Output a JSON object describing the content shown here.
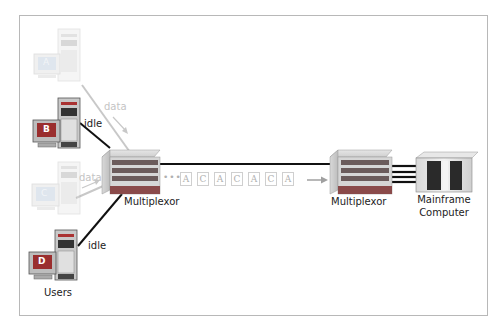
{
  "diagram": {
    "users_label": "Users",
    "terminals": [
      {
        "id": "A",
        "label": "A",
        "state": "faded",
        "link_label": "data"
      },
      {
        "id": "B",
        "label": "B",
        "state": "active",
        "link_label": "idle"
      },
      {
        "id": "C",
        "label": "C",
        "state": "faded",
        "link_label": "data"
      },
      {
        "id": "D",
        "label": "D",
        "state": "active",
        "link_label": "idle"
      }
    ],
    "multiplexor_left_label": "Multiplexor",
    "multiplexor_right_label": "Multiplexor",
    "mainframe_label_line1": "Mainframe",
    "mainframe_label_line2": "Computer",
    "stream_prefix": "•••",
    "stream_packets": [
      "A",
      "C",
      "A",
      "C",
      "A",
      "C",
      "A"
    ],
    "colors": {
      "frame": "#b8b8b8",
      "line_active": "#111111",
      "line_faded": "#c8c8c8",
      "packet_border": "#cfcfcf",
      "packet_text": "#b0b0b0",
      "arrow": "#a0a0a0"
    }
  }
}
